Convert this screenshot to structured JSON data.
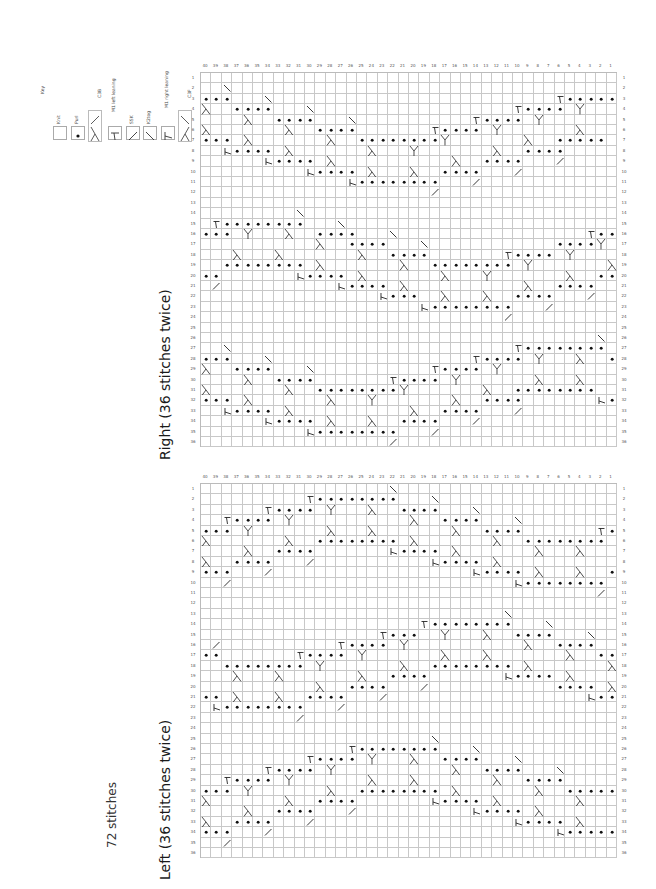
{
  "page": {
    "stitch_count_label": "72 stitches"
  },
  "key": {
    "title": "Key",
    "items": [
      {
        "symbol": "knit",
        "label": "Knit"
      },
      {
        "symbol": "purl",
        "label": "Purl"
      },
      {
        "symbol": "c3b",
        "label": "C3B"
      },
      {
        "symbol": "m1l",
        "label": "M1 left leaning"
      },
      {
        "symbol": "ssk",
        "label": "SSK"
      },
      {
        "symbol": "k2tog",
        "label": "K2tog"
      },
      {
        "symbol": "m1r",
        "label": "M1 right leaning"
      },
      {
        "symbol": "c3f",
        "label": "C3F"
      }
    ]
  },
  "charts": [
    {
      "id": "right",
      "title": "Right  (36 stitches twice)",
      "columns": 40,
      "rows": 36,
      "column_labels_left_to_right": [
        40,
        39,
        38,
        37,
        36,
        35,
        34,
        33,
        32,
        31,
        30,
        29,
        28,
        27,
        26,
        25,
        24,
        23,
        22,
        21,
        20,
        19,
        18,
        17,
        16,
        15,
        14,
        13,
        12,
        11,
        10,
        9,
        8,
        7,
        6,
        5,
        4,
        3,
        2,
        1
      ],
      "legend_codes": {
        ".": "knit",
        "o": "purl",
        "Y": "c3b",
        "C": "c3f",
        "T": "m1l",
        "R": "m1r",
        "s": "ssk",
        "k": "k2tog"
      },
      "grid_rows": [
        "........................................",
        "..s.....................................",
        "ooo...s...........................Tooooo",
        "C..oooo...s...................Toooo.Y...",
        "....C..oooo...s...........Toooo.Y.......",
        "C.......C..oooo.......Toooo.Y.......C...",
        "ooo.C.......C..ooooooooY.......C..ooooo.",
        "..Roooo.C.......C...Y.......C..oooo.....",
        "......Roooo.C...........C..oooo...k.....",
        "..........Roooo.C...C..oooo...k.........",
        "..............Roooooooo...k.............",
        "......................k.................",
        "........................................",
        ".........s..............................",
        ".Toooooooo...s..........................",
        "ooo.Y...C..oooo...s..................Too",
        "...........C..oooo...s............ooooY.",
        "...C...C.......C..oooo.......Toooo.Y....",
        "..oooooooo.C.......C..oooooooo.Y.......C",
        "oo.......Roooo.C.......C...Y.......C..oo",
        ".k...........Roooo.C...........C..oooo..",
        ".................Rooo..C...C..oooo...k..",
        ".....................Roooooooo...k......",
        ".............................k..........",
        "........................................",
        "......................................s.",
        "..s...........................Toooooooo.",
        "ooo...s...................Toooo.Y...C..o",
        "C..oooo...s...........Toooo.Y...........",
        "....C..oooo.......Toooo.Y.......C...C...",
        "C.......C..ooooooooY.......C..oooooooo..",
        "ooo.C.......C...Y.......C..oooo.......Ro",
        "..Roooo.C...........C..oooo...k.........",
        "......Roooo.C...C..oooo...k.............",
        "..........Roooooooo...k.................",
        "..................k....................."
      ]
    },
    {
      "id": "left",
      "title": "Left  (36 stitches twice)",
      "columns": 40,
      "rows": 36,
      "column_labels_left_to_right": [
        40,
        39,
        38,
        37,
        36,
        35,
        34,
        33,
        32,
        31,
        30,
        29,
        28,
        27,
        26,
        25,
        24,
        23,
        22,
        21,
        20,
        19,
        18,
        17,
        16,
        15,
        14,
        13,
        12,
        11,
        10,
        9,
        8,
        7,
        6,
        5,
        4,
        3,
        2,
        1
      ],
      "legend_codes": {
        ".": "knit",
        "o": "purl",
        "Y": "c3b",
        "C": "c3f",
        "T": "m1l",
        "R": "m1r",
        "s": "ssk",
        "k": "k2tog"
      },
      "grid_rows": [
        "..................s.....................",
        "..........Toooooooo...s.................",
        "......Toooo.Y...C..oooo...s.............",
        "..Toooo.Y...........C..oooo...s.........",
        "ooo.Y.......C...C.......C..oooo.......To",
        "C.......C..oooooooo.C.......C..oooooooo.",
        "....C..oooo.......Roooo.C.......C...C...",
        "C..oooo...k...........Roooo.C...........",
        "ooo...k...................Roooo.C...C..o",
        "..k...........................Roooooooo.",
        "......................................k.",
        "........................................",
        ".............................s..........",
        ".....................Toooooooo...s......",
        ".................Tooo..Y...C..oooo...s..",
        ".k...........Toooo.Y...........C..oooo..",
        "oo.......Toooo.Y.......C...C.......C..oo",
        "..oooooooo.Y.......C..oooooooo.C.......C",
        "...C...C.......C..oooo.......Roooo.C....",
        "...........C..oooo...k............oooo.C",
        "oo.C...C..oooo...k...................Roo",
        ".Roooooooo...k..........................",
        ".........k..............................",
        "........................................",
        "......................s.................",
        "..............Toooooooo...s.............",
        "..........Toooo.Y...C..oooo...s.........",
        "......Toooo.Y...........C..oooo...s.....",
        "..Toooo.Y.......C...C.......C..oooo.....",
        "ooo.Y.......C..oooooooo.C.......C..ooooo",
        "C.......C..oooo.......Roooo.C.......C...",
        "....C..oooo...k...........Roooo.C.......",
        "C..oooo...k...................Roooo.C...",
        "ooo...k...........................Rooooo",
        "..k.....................................",
        "........................................"
      ]
    }
  ]
}
